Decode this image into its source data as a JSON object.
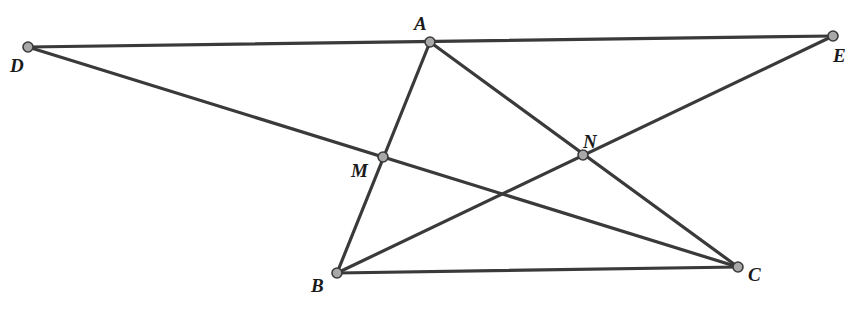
{
  "diagram": {
    "type": "geometry",
    "stroke_color": "#3a3a3a",
    "point_fill": "#a8a8a8",
    "points": {
      "A": {
        "x": 430,
        "y": 42,
        "label": "A",
        "lx": 414,
        "ly": 30
      },
      "B": {
        "x": 337,
        "y": 273,
        "label": "B",
        "lx": 311,
        "ly": 292
      },
      "C": {
        "x": 738,
        "y": 267,
        "label": "C",
        "lx": 748,
        "ly": 281
      },
      "D": {
        "x": 28,
        "y": 47,
        "label": "D",
        "lx": 10,
        "ly": 72
      },
      "E": {
        "x": 833,
        "y": 36,
        "label": "E",
        "lx": 833,
        "ly": 62
      },
      "M": {
        "x": 383,
        "y": 157,
        "label": "M",
        "lx": 351,
        "ly": 177
      },
      "N": {
        "x": 583,
        "y": 155,
        "label": "N",
        "lx": 583,
        "ly": 148
      }
    },
    "segments": [
      {
        "from": "D",
        "to": "E"
      },
      {
        "from": "D",
        "to": "C"
      },
      {
        "from": "A",
        "to": "B"
      },
      {
        "from": "A",
        "to": "C"
      },
      {
        "from": "B",
        "to": "E"
      },
      {
        "from": "B",
        "to": "C"
      }
    ]
  }
}
